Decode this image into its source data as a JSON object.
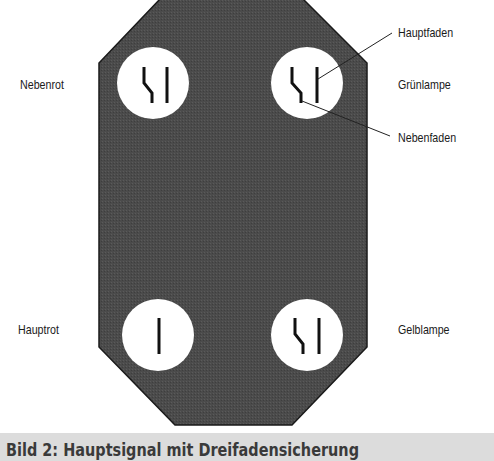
{
  "diagram": {
    "title": "Hauptsignal mit Dreifadensicherung",
    "colors": {
      "body": "#4a4a4a",
      "lamp": "#ffffff",
      "filament": "#111111",
      "caption_bg": "#dcdcdc"
    },
    "lamps": [
      {
        "id": "nebenrot",
        "label": "Nebenrot",
        "side": "left",
        "filaments": [
          "nebenfaden",
          "hauptfaden"
        ]
      },
      {
        "id": "gruenlampe",
        "label": "Grünlampe",
        "side": "right",
        "filaments": [
          "nebenfaden",
          "hauptfaden"
        ]
      },
      {
        "id": "hauptrot",
        "label": "Hauptrot",
        "side": "left",
        "filaments": [
          "hauptfaden"
        ]
      },
      {
        "id": "gelblampe",
        "label": "Gelblampe",
        "side": "right",
        "filaments": [
          "nebenfaden",
          "hauptfaden"
        ]
      }
    ],
    "callouts": [
      {
        "label": "Hauptfaden",
        "target": "gruenlampe.hauptfaden"
      },
      {
        "label": "Nebenfaden",
        "target": "gruenlampe.nebenfaden"
      }
    ]
  },
  "labels": {
    "nebenrot": "Nebenrot",
    "gruenlampe": "Grünlampe",
    "hauptrot": "Hauptrot",
    "gelblampe": "Gelblampe",
    "hauptfaden": "Hauptfaden",
    "nebenfaden": "Nebenfaden"
  },
  "caption": "Bild 2:  Hauptsignal mit Dreifadensicherung"
}
